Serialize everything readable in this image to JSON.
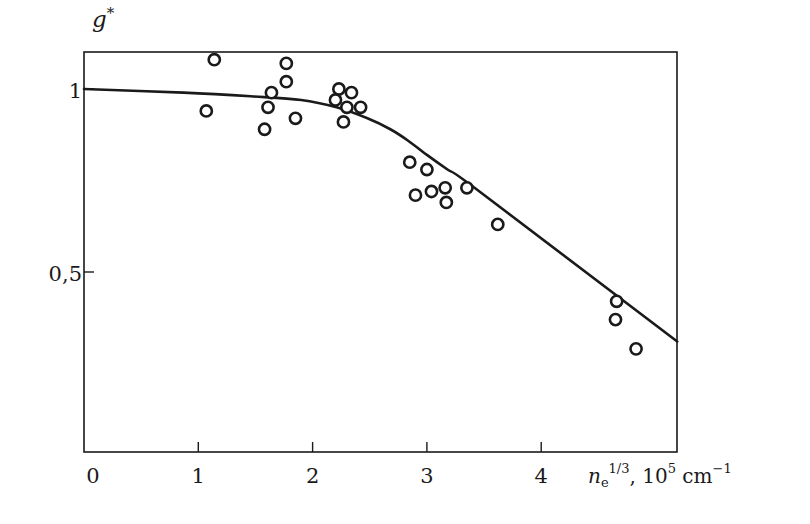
{
  "chart_data": {
    "type": "scatter",
    "title": "",
    "xlabel": "n_e^{1/3}, 10^5 cm^-1",
    "ylabel": "g*",
    "xlim": [
      0,
      5.2
    ],
    "ylim": [
      0,
      1.1
    ],
    "grid": false,
    "legend": null,
    "x_ticks": [
      0,
      1,
      2,
      3,
      4
    ],
    "x_tick_labels": [
      "0",
      "1",
      "2",
      "3",
      "4"
    ],
    "y_ticks": [
      1,
      0.5
    ],
    "y_tick_labels": [
      "1",
      "0,5"
    ],
    "series": [
      {
        "name": "experimental points",
        "kind": "scatter",
        "marker": "open-circle",
        "points": [
          [
            1.14,
            1.08
          ],
          [
            1.07,
            0.94
          ],
          [
            1.77,
            1.07
          ],
          [
            1.77,
            1.02
          ],
          [
            1.64,
            0.99
          ],
          [
            1.61,
            0.95
          ],
          [
            1.58,
            0.89
          ],
          [
            1.85,
            0.92
          ],
          [
            2.23,
            1.0
          ],
          [
            2.34,
            0.99
          ],
          [
            2.2,
            0.97
          ],
          [
            2.3,
            0.95
          ],
          [
            2.42,
            0.95
          ],
          [
            2.27,
            0.91
          ],
          [
            2.85,
            0.8
          ],
          [
            3.0,
            0.78
          ],
          [
            2.9,
            0.71
          ],
          [
            3.04,
            0.72
          ],
          [
            3.16,
            0.73
          ],
          [
            3.17,
            0.69
          ],
          [
            3.35,
            0.73
          ],
          [
            3.62,
            0.63
          ],
          [
            4.66,
            0.42
          ],
          [
            4.65,
            0.37
          ],
          [
            4.83,
            0.29
          ]
        ]
      },
      {
        "name": "theoretical curve",
        "kind": "line",
        "points": [
          [
            0,
            1.0
          ],
          [
            0.87,
            0.99
          ],
          [
            1.46,
            0.98
          ],
          [
            1.9,
            0.97
          ],
          [
            2.21,
            0.95
          ],
          [
            2.48,
            0.92
          ],
          [
            2.68,
            0.89
          ],
          [
            2.83,
            0.86
          ],
          [
            3.0,
            0.82
          ],
          [
            3.18,
            0.78
          ],
          [
            3.46,
            0.72
          ],
          [
            5.19,
            0.31
          ]
        ]
      }
    ]
  },
  "labels": {
    "y_axis_symbol": "g",
    "y_axis_sup": "*",
    "x_axis_var": "n",
    "x_axis_sub": "e",
    "x_axis_sup": "1/3",
    "x_axis_units_prefix": ", 10",
    "x_axis_units_exp": "5",
    "x_axis_units_mid": " cm",
    "x_axis_units_exp2": "−1"
  },
  "colors": {
    "ink": "#1a1a1a",
    "background": "#ffffff"
  }
}
